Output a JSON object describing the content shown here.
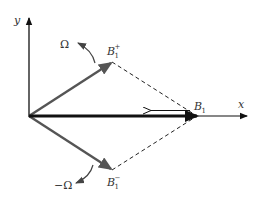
{
  "diagram": {
    "title": "",
    "axes": {
      "x_label": "x",
      "y_label": "y"
    },
    "vectors": {
      "b1_plus": {
        "base": "B",
        "sub": "1",
        "sup": "+"
      },
      "b1_minus": {
        "base": "B",
        "sub": "1",
        "sup": "−"
      },
      "b1": {
        "base": "B",
        "sub": "1"
      }
    },
    "rotations": {
      "positive": "Ω",
      "negative": "−Ω"
    },
    "colors": {
      "axis": "#111111",
      "rotating_vector": "#555555",
      "resultant_vector": "#111111",
      "dashed": "#222222",
      "label": "#333333"
    }
  }
}
